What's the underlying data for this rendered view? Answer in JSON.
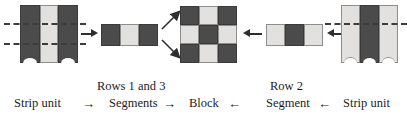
{
  "figure": {
    "type": "quilting-construction-diagram",
    "colors": {
      "dark_fabric": "#4b4b4b",
      "light_fabric": "#e2e1df",
      "line": "#2e2e2e",
      "background": "#ffffff",
      "text": "#1d1d1d"
    }
  },
  "captions": {
    "left_strip_unit": "Strip unit",
    "rows_1_and_3": "Rows 1 and 3",
    "segments": "Segments",
    "block": "Block",
    "row_2": "Row 2",
    "segment": "Segment",
    "right_strip_unit": "Strip unit",
    "arrow_right_1": "→",
    "arrow_right_2": "→",
    "arrow_left_1": "←",
    "arrow_left_2": "←"
  },
  "left_strip_unit": {
    "label": "Strip unit",
    "strips": [
      "dark",
      "light",
      "dark"
    ],
    "cut_lines": 2
  },
  "rows13_segment": {
    "label": "Rows 1 and 3 Segments",
    "patches": [
      "dark",
      "light",
      "dark"
    ]
  },
  "block": {
    "label": "Block",
    "grid": [
      [
        "dark",
        "light",
        "dark"
      ],
      [
        "light",
        "dark",
        "light"
      ],
      [
        "dark",
        "light",
        "dark"
      ]
    ]
  },
  "row2_segment": {
    "label": "Row 2 Segment",
    "patches": [
      "light",
      "dark",
      "light"
    ]
  },
  "right_strip_unit": {
    "label": "Strip unit",
    "strips": [
      "light",
      "dark",
      "light"
    ],
    "cut_lines": 1
  }
}
